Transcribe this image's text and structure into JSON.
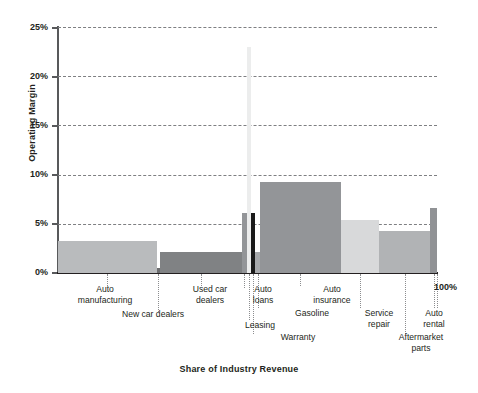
{
  "chart_data": {
    "type": "bar",
    "title": "",
    "xlabel": "Share of Industry Revenue",
    "ylabel": "Operating Margin",
    "ylim": [
      0,
      25
    ],
    "xlim": [
      0,
      100
    ],
    "grid": true,
    "legend": "none",
    "variable_width": true,
    "note": "Marimekko-style bar chart: bar width = share of industry revenue (%), bar height = operating margin (%)",
    "y_ticks": [
      "0%",
      "5%",
      "10%",
      "15%",
      "20%",
      "25%"
    ],
    "y_tick_values": [
      0,
      5,
      10,
      15,
      20,
      25
    ],
    "x_ticks": [
      "100%"
    ],
    "x_tick_values": [
      100
    ],
    "categories": [
      "Auto manufacturing",
      "New car dealers",
      "Used car dealers",
      "Auto loans",
      "Leasing",
      "Warranty",
      "Gasoline",
      "Auto insurance",
      "Service repair",
      "Aftermarket parts",
      "Auto rental"
    ],
    "values": [
      3.3,
      0.5,
      2.1,
      6.1,
      23.0,
      6.1,
      2.1,
      9.2,
      5.4,
      4.3,
      6.6
    ],
    "widths": [
      26.0,
      1.0,
      21.5,
      1.4,
      1.1,
      1.1,
      1.1,
      21.5,
      10.0,
      13.5,
      1.8
    ],
    "x_start": [
      0.0,
      26.0,
      27.0,
      48.5,
      49.9,
      51.0,
      52.1,
      53.2,
      74.7,
      84.7,
      98.2
    ],
    "colors": [
      "#b9bbbd",
      "#6d6e70",
      "#808284",
      "#939598",
      "#eceded",
      "#1a1a1a",
      "#a7a9ac",
      "#939598",
      "#d8d9da",
      "#b1b3b5",
      "#909295"
    ]
  },
  "axes": {
    "y_title": "Operating Margin",
    "x_title": "Share of Industry Revenue",
    "y_labels": [
      "25%",
      "20%",
      "15%",
      "10%",
      "5%",
      "0%"
    ],
    "x_end_label": "100%"
  },
  "series_labels": [
    {
      "text": "Auto\nmanufacturing"
    },
    {
      "text": "New car dealers"
    },
    {
      "text": "Used car\ndealers"
    },
    {
      "text": "Auto\nloans"
    },
    {
      "text": "Leasing"
    },
    {
      "text": "Warranty"
    },
    {
      "text": "Gasoline"
    },
    {
      "text": "Auto\ninsurance"
    },
    {
      "text": "Service\nrepair"
    },
    {
      "text": "Aftermarket\nparts"
    },
    {
      "text": "Auto\nrental"
    }
  ]
}
